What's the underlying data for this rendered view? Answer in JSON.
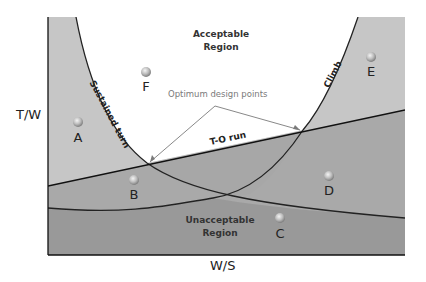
{
  "axes": {
    "x_label": "W/S",
    "y_label": "T/W"
  },
  "regions": {
    "acceptable": {
      "line1": "Acceptable",
      "line2": "Region"
    },
    "unacceptable": {
      "line1": "Unacceptable",
      "line2": "Region"
    }
  },
  "curves": {
    "sustained_turn": "Sustained turn",
    "climb": "Climb",
    "takeoff_run": "T-O run"
  },
  "annotation": {
    "optimum": "Optimum design points"
  },
  "points": [
    {
      "label": "A",
      "x": 78,
      "y": 122
    },
    {
      "label": "B",
      "x": 134,
      "y": 180
    },
    {
      "label": "C",
      "x": 280,
      "y": 218
    },
    {
      "label": "D",
      "x": 329,
      "y": 176
    },
    {
      "label": "E",
      "x": 371,
      "y": 57
    },
    {
      "label": "F",
      "x": 146,
      "y": 72
    }
  ],
  "colors": {
    "light_gray": "#c4c4c4",
    "mid_gray": "#a8a8a8",
    "dark_gray": "#9a9a9a",
    "darkest_gray": "#8e8e8e",
    "line": "#222222",
    "arrow": "#7a7a7a",
    "background": "#ffffff"
  }
}
